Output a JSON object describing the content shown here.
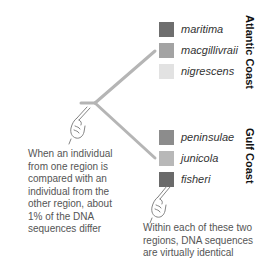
{
  "groups": [
    {
      "region": "Atlantic Coast",
      "taxa": [
        {
          "name": "maritima",
          "color": "#6e6e6e"
        },
        {
          "name": "macgillivraii",
          "color": "#a3a3a3"
        },
        {
          "name": "nigrescens",
          "color": "#e2e2e2"
        }
      ]
    },
    {
      "region": "Gulf Coast",
      "taxa": [
        {
          "name": "peninsulae",
          "color": "#8c8c8c"
        },
        {
          "name": "junicola",
          "color": "#b8b8b8"
        },
        {
          "name": "fisheri",
          "color": "#6a6a6a"
        }
      ]
    }
  ],
  "notes": {
    "between": "When an individual from one region is compared with an individual from the other region, about 1% of the DNA sequences differ",
    "within": "Within each of these two regions, DNA sequences are virtually identical"
  },
  "colors": {
    "branch": "#b5b5b5"
  }
}
